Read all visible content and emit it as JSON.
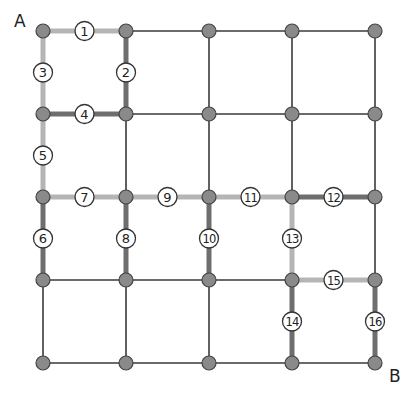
{
  "diagram": {
    "type": "grid-graph",
    "corner_labels": {
      "start": "A",
      "end": "B"
    },
    "grid": {
      "cols": 5,
      "rows": 5,
      "x": [
        43,
        126,
        209,
        292,
        375
      ],
      "y": [
        31,
        114,
        197,
        280,
        363
      ]
    },
    "colors": {
      "node_fill": "#8a8a8a",
      "node_stroke": "#444444",
      "thin_edge": "#3a3a3a",
      "light_edge": "#b5b5b5",
      "dark_edge": "#6e6e6e",
      "badge_fill": "#ffffff",
      "badge_stroke": "#333333"
    },
    "numbered_edges": [
      {
        "n": "1",
        "from": [
          0,
          0
        ],
        "to": [
          1,
          0
        ],
        "style": "light"
      },
      {
        "n": "2",
        "from": [
          1,
          0
        ],
        "to": [
          1,
          1
        ],
        "style": "dark"
      },
      {
        "n": "3",
        "from": [
          0,
          0
        ],
        "to": [
          0,
          1
        ],
        "style": "light"
      },
      {
        "n": "4",
        "from": [
          0,
          1
        ],
        "to": [
          1,
          1
        ],
        "style": "dark"
      },
      {
        "n": "5",
        "from": [
          0,
          1
        ],
        "to": [
          0,
          2
        ],
        "style": "light"
      },
      {
        "n": "6",
        "from": [
          0,
          2
        ],
        "to": [
          0,
          3
        ],
        "style": "dark"
      },
      {
        "n": "7",
        "from": [
          0,
          2
        ],
        "to": [
          1,
          2
        ],
        "style": "light"
      },
      {
        "n": "8",
        "from": [
          1,
          2
        ],
        "to": [
          1,
          3
        ],
        "style": "dark"
      },
      {
        "n": "9",
        "from": [
          1,
          2
        ],
        "to": [
          2,
          2
        ],
        "style": "light"
      },
      {
        "n": "10",
        "from": [
          2,
          2
        ],
        "to": [
          2,
          3
        ],
        "style": "dark"
      },
      {
        "n": "11",
        "from": [
          2,
          2
        ],
        "to": [
          3,
          2
        ],
        "style": "light"
      },
      {
        "n": "12",
        "from": [
          3,
          2
        ],
        "to": [
          4,
          2
        ],
        "style": "dark"
      },
      {
        "n": "13",
        "from": [
          3,
          2
        ],
        "to": [
          3,
          3
        ],
        "style": "light"
      },
      {
        "n": "14",
        "from": [
          3,
          3
        ],
        "to": [
          3,
          4
        ],
        "style": "dark"
      },
      {
        "n": "15",
        "from": [
          3,
          3
        ],
        "to": [
          4,
          3
        ],
        "style": "light"
      },
      {
        "n": "16",
        "from": [
          4,
          3
        ],
        "to": [
          4,
          4
        ],
        "style": "dark"
      }
    ]
  }
}
